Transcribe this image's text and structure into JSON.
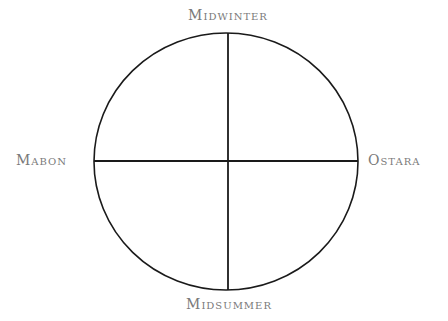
{
  "diagram": {
    "type": "wheel-of-the-year-quadrants",
    "labels": {
      "top": "Midwinter",
      "bottom": "Midsummer",
      "left": "Mabon",
      "right": "Ostara"
    },
    "colors": {
      "line": "#1a1a1a",
      "label": "#7a7a7a",
      "background": "#ffffff"
    }
  }
}
